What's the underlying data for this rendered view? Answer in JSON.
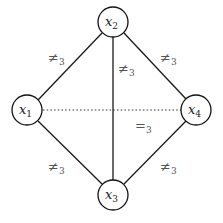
{
  "diagram": {
    "title": "",
    "nodes": [
      {
        "id": "x1",
        "label": "x",
        "subscript": "1",
        "cx": 27,
        "cy": 110
      },
      {
        "id": "x2",
        "label": "x",
        "subscript": "2",
        "cx": 113,
        "cy": 22
      },
      {
        "id": "x3",
        "label": "x",
        "subscript": "3",
        "cx": 113,
        "cy": 195
      },
      {
        "id": "x4",
        "label": "x",
        "subscript": "4",
        "cx": 196,
        "cy": 110
      }
    ],
    "edges": [
      {
        "from": "x1",
        "to": "x2",
        "style": "solid",
        "label": "≠",
        "subscript": "3"
      },
      {
        "from": "x2",
        "to": "x4",
        "style": "solid",
        "label": "≠",
        "subscript": "3"
      },
      {
        "from": "x2",
        "to": "x3",
        "style": "solid",
        "label": "≠",
        "subscript": "3"
      },
      {
        "from": "x1",
        "to": "x3",
        "style": "solid",
        "label": "≠",
        "subscript": "3"
      },
      {
        "from": "x3",
        "to": "x4",
        "style": "solid",
        "label": "≠",
        "subscript": "3"
      },
      {
        "from": "x1",
        "to": "x4",
        "style": "dotted",
        "label": "=",
        "subscript": "3"
      }
    ]
  }
}
